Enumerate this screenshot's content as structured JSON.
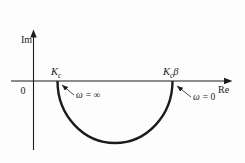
{
  "diagram_type": "nyquist-polar-plot",
  "axes": {
    "imaginary_label": "Im",
    "real_label": "Re",
    "origin": "0"
  },
  "points": {
    "kc": {
      "base": "K",
      "sub": "c"
    },
    "kcb": {
      "base": "K",
      "sub": "c",
      "suffix": "β"
    }
  },
  "annotations": {
    "omega_infinity": {
      "symbol": "ω",
      "value": "= ∞"
    },
    "omega_zero": {
      "symbol": "ω",
      "value": "= 0"
    }
  },
  "colors": {
    "ink": "#1c1c1c",
    "background": "#fdfdfd"
  }
}
